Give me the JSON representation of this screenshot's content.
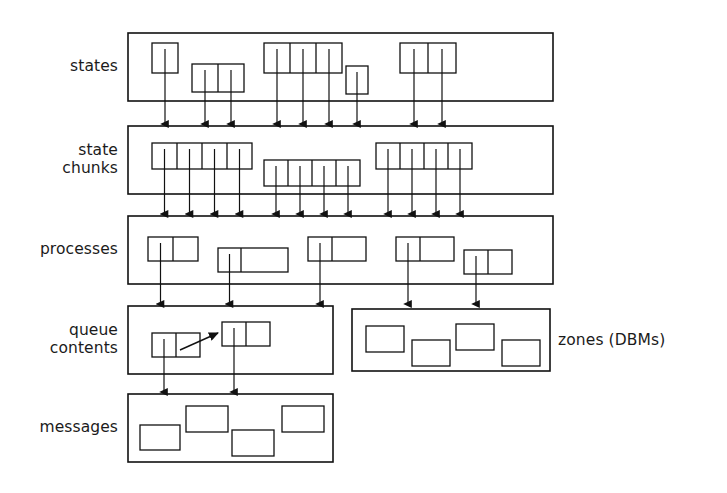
{
  "figure": {
    "stroke_color": "#111111",
    "background_color": "#ffffff"
  },
  "labels": {
    "states": "states",
    "state_chunks": "state\nchunks",
    "processes": "processes",
    "queue_contents": "queue\ncontents",
    "messages": "messages",
    "zones": "zones (DBMs)"
  },
  "chart_data": {
    "type": "diagram",
    "layers": [
      {
        "name": "states",
        "label": "states",
        "container": {
          "x": 128,
          "y": 33,
          "w": 425,
          "h": 68
        },
        "objects": [
          {
            "cells": 1,
            "x": 152,
            "y": 43,
            "cell_w": 26,
            "h": 30,
            "arrows_from_cells": [
              0
            ]
          },
          {
            "cells": 2,
            "x": 192,
            "y": 64,
            "cell_w": 26,
            "h": 28,
            "arrows_from_cells": [
              0,
              1
            ]
          },
          {
            "cells": 3,
            "x": 264,
            "y": 43,
            "cell_w": 26,
            "h": 30,
            "arrows_from_cells": [
              0,
              1,
              2
            ]
          },
          {
            "cells": 1,
            "x": 346,
            "y": 66,
            "cell_w": 22,
            "h": 28,
            "arrows_from_cells": [
              0
            ]
          },
          {
            "cells": 2,
            "x": 400,
            "y": 43,
            "cell_w": 28,
            "h": 30,
            "arrows_from_cells": [
              0,
              1
            ]
          }
        ],
        "arrow_count": 9
      },
      {
        "name": "state_chunks",
        "label": "state chunks",
        "container": {
          "x": 128,
          "y": 126,
          "w": 425,
          "h": 68
        },
        "objects": [
          {
            "cells": 4,
            "x": 152,
            "y": 143,
            "cell_w": 25,
            "h": 26,
            "arrows_from_cells": [
              0,
              1,
              2,
              3
            ]
          },
          {
            "cells": 4,
            "x": 264,
            "y": 160,
            "cell_w": 24,
            "h": 26,
            "arrows_from_cells": [
              0,
              1,
              2,
              3
            ]
          },
          {
            "cells": 4,
            "x": 376,
            "y": 143,
            "cell_w": 24,
            "h": 26,
            "arrows_from_cells": [
              0,
              1,
              2,
              3
            ]
          }
        ],
        "arrow_count": 12
      },
      {
        "name": "processes",
        "label": "processes",
        "container": {
          "x": 128,
          "y": 216,
          "w": 425,
          "h": 68
        },
        "objects": [
          {
            "cells": 2,
            "x": 148,
            "y": 237,
            "cell_w": 25,
            "h": 24,
            "arrows_from_cells": [
              0
            ]
          },
          {
            "cells": 2,
            "x": 218,
            "y": 248,
            "cell_w": 23,
            "h": 24,
            "cell_w2": 47,
            "arrows_from_cells": [
              0
            ]
          },
          {
            "cells": 2,
            "x": 308,
            "y": 237,
            "cell_w": 24,
            "h": 24,
            "cell_w2": 34,
            "arrows_from_cells": [
              0
            ]
          },
          {
            "cells": 2,
            "x": 396,
            "y": 237,
            "cell_w": 24,
            "h": 24,
            "cell_w2": 34,
            "arrows_from_cells": [
              0
            ]
          },
          {
            "cells": 2,
            "x": 464,
            "y": 250,
            "cell_w": 24,
            "h": 24,
            "arrows_from_cells": [
              0
            ]
          }
        ],
        "arrow_count": 5,
        "arrow_targets": [
          "queue_contents",
          "queue_contents",
          "queue_contents",
          "zones",
          "zones"
        ]
      },
      {
        "name": "queue_contents",
        "label": "queue contents",
        "container": {
          "x": 128,
          "y": 306,
          "w": 205,
          "h": 68
        },
        "objects": [
          {
            "cells": 2,
            "x": 152,
            "y": 333,
            "cell_w": 24,
            "h": 24,
            "arrows_from_cells": [
              0
            ]
          },
          {
            "cells": 2,
            "x": 222,
            "y": 322,
            "cell_w": 24,
            "h": 24,
            "arrows_from_cells": [
              0
            ]
          }
        ],
        "internal_arrow": {
          "from_x": 180,
          "from_y": 350,
          "to_x": 218,
          "to_y": 333
        },
        "arrow_count": 2
      },
      {
        "name": "zones",
        "label": "zones (DBMs)",
        "container": {
          "x": 352,
          "y": 309,
          "w": 198,
          "h": 62
        },
        "objects": [
          {
            "cells": 1,
            "x": 366,
            "y": 326,
            "cell_w": 38,
            "h": 26
          },
          {
            "cells": 1,
            "x": 412,
            "y": 340,
            "cell_w": 38,
            "h": 26
          },
          {
            "cells": 1,
            "x": 456,
            "y": 324,
            "cell_w": 38,
            "h": 26
          },
          {
            "cells": 1,
            "x": 502,
            "y": 340,
            "cell_w": 38,
            "h": 26
          }
        ],
        "arrow_count": 0
      },
      {
        "name": "messages",
        "label": "messages",
        "container": {
          "x": 128,
          "y": 394,
          "w": 205,
          "h": 68
        },
        "objects": [
          {
            "cells": 1,
            "x": 140,
            "y": 425,
            "cell_w": 40,
            "h": 25
          },
          {
            "cells": 1,
            "x": 186,
            "y": 406,
            "cell_w": 42,
            "h": 26
          },
          {
            "cells": 1,
            "x": 232,
            "y": 430,
            "cell_w": 42,
            "h": 26
          },
          {
            "cells": 1,
            "x": 282,
            "y": 406,
            "cell_w": 42,
            "h": 26
          }
        ],
        "arrow_count": 0
      }
    ],
    "arrow_sets": [
      {
        "from_layer": "states",
        "to_layer": "state_chunks",
        "xs": [
          160,
          200,
          226,
          272,
          298,
          324,
          356,
          412,
          440
        ],
        "y_start_offsets": [
          43,
          64,
          64,
          43,
          43,
          43,
          66,
          43,
          43
        ],
        "y_end": 124
      },
      {
        "from_layer": "state_chunks",
        "to_layer": "processes",
        "xs": [
          160,
          186,
          212,
          238,
          272,
          298,
          324,
          350,
          384,
          410,
          436,
          462
        ],
        "y_end": 214
      },
      {
        "from_layer": "processes",
        "to_layer": "queue_contents_and_zones",
        "xs": [
          158,
          228,
          318,
          406,
          474
        ],
        "y_end": 304
      },
      {
        "from_layer": "queue_contents",
        "to_layer": "messages",
        "xs": [
          162,
          232
        ],
        "y_end": 392
      }
    ]
  }
}
